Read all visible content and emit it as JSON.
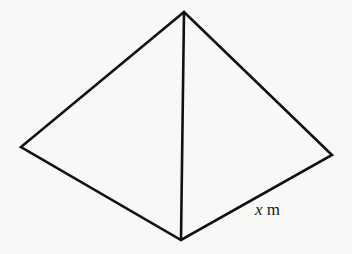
{
  "figure": {
    "vertices": {
      "apex": [
        184,
        12
      ],
      "left": [
        21,
        147
      ],
      "right": [
        332,
        155
      ],
      "bottom": [
        181,
        240
      ]
    },
    "edge_color": "#111111",
    "background_color": "#f8f8f6"
  },
  "label": {
    "variable": "x",
    "unit": "m"
  }
}
